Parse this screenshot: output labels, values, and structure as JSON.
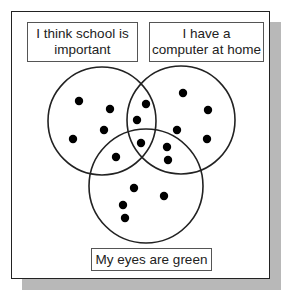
{
  "diagram": {
    "type": "venn",
    "sets": [
      {
        "id": "school",
        "label": "I think school is important",
        "circle": {
          "cx": 102,
          "cy": 121,
          "r": 54
        }
      },
      {
        "id": "computer",
        "label": "I have a computer at home",
        "circle": {
          "cx": 181,
          "cy": 120,
          "r": 54
        }
      },
      {
        "id": "eyes",
        "label": "My eyes are green",
        "circle": {
          "cx": 146,
          "cy": 186,
          "r": 57
        }
      }
    ],
    "labels": {
      "school_line1": "I think school is",
      "school_line2": "important",
      "computer_line1": "I have a",
      "computer_line2": "computer at home",
      "eyes": "My eyes are green"
    },
    "dots": [
      {
        "x": 79,
        "y": 101,
        "region": "school only"
      },
      {
        "x": 110,
        "y": 109,
        "region": "school only"
      },
      {
        "x": 104,
        "y": 130,
        "region": "school only"
      },
      {
        "x": 73,
        "y": 139,
        "region": "school only"
      },
      {
        "x": 146,
        "y": 104,
        "region": "school and computer"
      },
      {
        "x": 137,
        "y": 120,
        "region": "school and computer"
      },
      {
        "x": 141,
        "y": 143,
        "region": "school, computer and eyes"
      },
      {
        "x": 116,
        "y": 157,
        "region": "school and eyes"
      },
      {
        "x": 183,
        "y": 93,
        "region": "computer only"
      },
      {
        "x": 208,
        "y": 110,
        "region": "computer only"
      },
      {
        "x": 177,
        "y": 130,
        "region": "computer only"
      },
      {
        "x": 207,
        "y": 139,
        "region": "computer only"
      },
      {
        "x": 167,
        "y": 147,
        "region": "computer and eyes"
      },
      {
        "x": 168,
        "y": 160,
        "region": "computer and eyes"
      },
      {
        "x": 134,
        "y": 188,
        "region": "eyes only"
      },
      {
        "x": 164,
        "y": 196,
        "region": "eyes only"
      },
      {
        "x": 123,
        "y": 205,
        "region": "eyes only"
      },
      {
        "x": 125,
        "y": 218,
        "region": "eyes only"
      }
    ],
    "dot_count": 18,
    "colors": {
      "stroke": "#222222",
      "dot": "#000000",
      "shadow": "#b8b8b8",
      "label_border": "#555555"
    }
  }
}
